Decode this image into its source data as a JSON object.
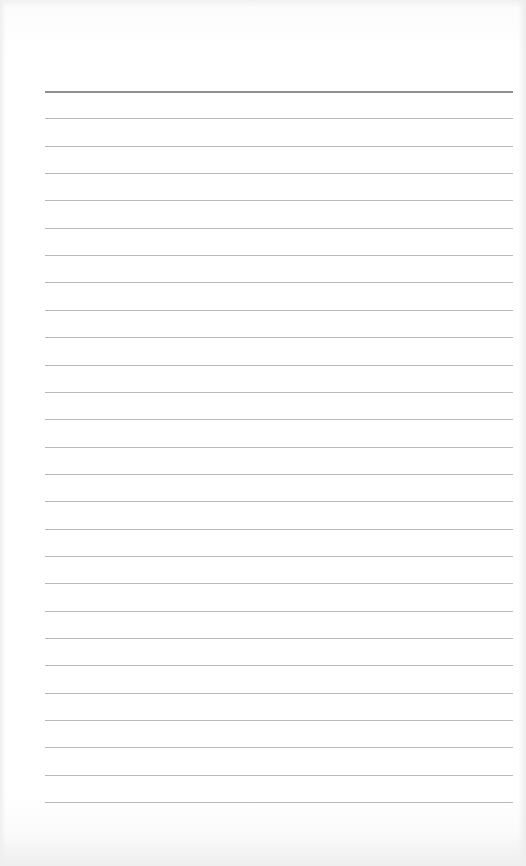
{
  "page": {
    "type": "lined-paper",
    "background_color": "#ffffff",
    "line_color": "#b9b9b9",
    "header_line_color": "#8f8f8f",
    "line_count": 27,
    "first_line_y": 91,
    "line_spacing": 27.35,
    "line_left": 45,
    "line_width": 468,
    "text_content": ""
  }
}
